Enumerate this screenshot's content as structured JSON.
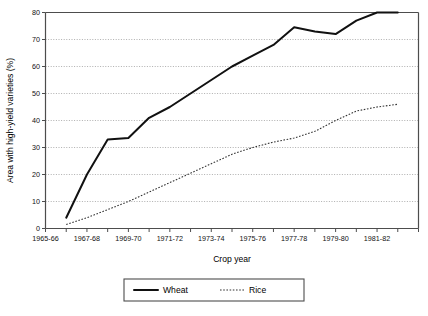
{
  "chart_data": {
    "type": "line",
    "title": "",
    "xlabel": "Crop year",
    "ylabel": "Area with high-yield varieties (%)",
    "ylim": [
      0,
      80
    ],
    "ytick_step": 10,
    "yticks": [
      "0",
      "10",
      "20",
      "30",
      "40",
      "50",
      "60",
      "70",
      "80"
    ],
    "grid": "horizontal-dotted",
    "legend_position": "bottom-center",
    "x": [
      "1965-66",
      "1966-67",
      "1967-68",
      "1968-69",
      "1969-70",
      "1970-71",
      "1971-72",
      "1972-73",
      "1973-74",
      "1974-75",
      "1975-76",
      "1976-77",
      "1977-78",
      "1978-79",
      "1979-80",
      "1980-81",
      "1981-82",
      "1982-83",
      "1983-84"
    ],
    "xticklabels": [
      "1965-66",
      "",
      "1967-68",
      "",
      "1969-70",
      "",
      "1971-72",
      "",
      "1973-74",
      "",
      "1975-76",
      "",
      "1977-78",
      "",
      "1979-80",
      "",
      "1981-82",
      "",
      ""
    ],
    "series": [
      {
        "name": "Wheat",
        "style": "solid",
        "color": "#111111",
        "values": [
          null,
          4,
          20,
          33,
          33.5,
          41,
          45,
          50,
          55,
          60,
          64,
          68,
          74.5,
          73,
          72,
          77,
          80,
          80,
          null
        ]
      },
      {
        "name": "Rice",
        "style": "dotted",
        "color": "#333333",
        "values": [
          null,
          1.5,
          4,
          7,
          10,
          13.5,
          17,
          20.5,
          24,
          27.5,
          30,
          32,
          33.5,
          36,
          40,
          43.5,
          45,
          46,
          null
        ]
      }
    ],
    "legend": [
      {
        "label": "Wheat",
        "style": "solid"
      },
      {
        "label": "Rice",
        "style": "dotted"
      }
    ]
  }
}
